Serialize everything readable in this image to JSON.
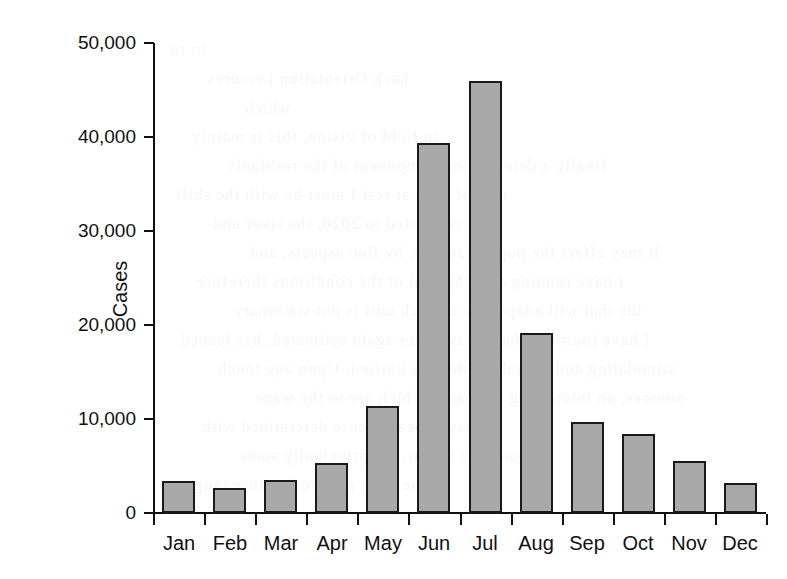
{
  "chart_data": {
    "type": "bar",
    "title": "",
    "xlabel": "",
    "ylabel": "Cases",
    "categories": [
      "Jan",
      "Feb",
      "Mar",
      "Apr",
      "May",
      "Jun",
      "Jul",
      "Aug",
      "Sep",
      "Oct",
      "Nov",
      "Dec"
    ],
    "values": [
      3400,
      2700,
      3500,
      5300,
      11400,
      39400,
      46000,
      19100,
      9700,
      8400,
      5500,
      3200
    ],
    "ylim": [
      0,
      50000
    ],
    "ytick_labels": [
      "50,000",
      "40,000",
      "30,000",
      "20,000",
      "10,000",
      "0"
    ],
    "ytick_values": [
      50000,
      40000,
      30000,
      20000,
      10000,
      0
    ],
    "grid": false,
    "legend": null,
    "bar_fill_color": "#a9a9a9",
    "bar_border_color": "#1a1a1a",
    "axis_color": "#111111",
    "background_color": "#ffffff"
  },
  "ghost_text": {
    "lines": [
      "in tu",
      "hack Orientation Lectures",
      "which",
      "In field of vision, this is mainly",
      "finally a determining component of the residuals",
      "tion of gaze at rest I must be with the shift",
      "converted to 2020, the river and",
      "It may affect the pupil diameter, by fine aspects, and",
      "I have running and physical of the conditions therefore",
      "the that will adaptation of each unit is not stationary",
      "I have journeys that I was. After again estimated, has leaned",
      "stimulating and stimuli he derives unified. Upon any touch",
      "sources, an interesting the bands which are to the wane",
      "may appear a more determined with",
      "tion, as a bright, are principally some",
      "the most practical nature range"
    ]
  }
}
